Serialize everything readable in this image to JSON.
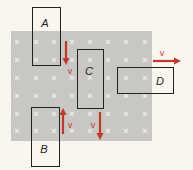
{
  "colors": {
    "background": "#f8f6ee",
    "field": "#c9c7c4",
    "marker": "#f1efea",
    "box": "#222222",
    "arrow": "#c0392b"
  },
  "field": {
    "x": 11,
    "y": 31,
    "w": 141,
    "h": 110,
    "symbol": "×",
    "cols": [
      17,
      36,
      54,
      72,
      90,
      108,
      126,
      145
    ],
    "rows": [
      42,
      60,
      78,
      96,
      114,
      131
    ]
  },
  "loops": [
    {
      "label": "A",
      "x": 32,
      "y": 7,
      "w": 28,
      "h": 58,
      "lx": 45,
      "ly": 27
    },
    {
      "label": "B",
      "x": 31,
      "y": 107,
      "w": 28,
      "h": 59,
      "lx": 44,
      "ly": 153
    },
    {
      "label": "C",
      "x": 77,
      "y": 49,
      "w": 26,
      "h": 59,
      "lx": 89,
      "ly": 75
    },
    {
      "label": "D",
      "x": 117,
      "y": 67,
      "w": 56,
      "h": 26,
      "lx": 160,
      "ly": 85
    }
  ],
  "velocities": [
    {
      "label": "v",
      "x1": 66,
      "y1": 41,
      "x2": 66,
      "y2": 65,
      "lx": 70,
      "ly": 74
    },
    {
      "label": "v",
      "x1": 63,
      "y1": 134,
      "x2": 63,
      "y2": 108,
      "lx": 70,
      "ly": 128
    },
    {
      "label": "v",
      "x1": 100,
      "y1": 112,
      "x2": 100,
      "y2": 140,
      "lx": 93,
      "ly": 128
    },
    {
      "label": "v",
      "x1": 153,
      "y1": 61,
      "x2": 181,
      "y2": 61,
      "lx": 162,
      "ly": 56
    }
  ]
}
